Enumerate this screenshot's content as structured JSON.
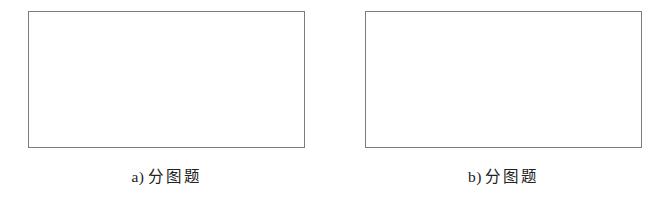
{
  "document": {
    "type": "figure-group",
    "background_color": "#ffffff",
    "frame_border_color": "#7c7c7c",
    "text_color": "#222222"
  },
  "subfigures": [
    {
      "id": "subfigure-a",
      "enumerator": "a)",
      "caption_text": "分图题",
      "frame_fill": "#ffffff"
    },
    {
      "id": "subfigure-b",
      "enumerator": "b)",
      "caption_text": "分图题",
      "frame_fill": "#ffffff"
    }
  ]
}
